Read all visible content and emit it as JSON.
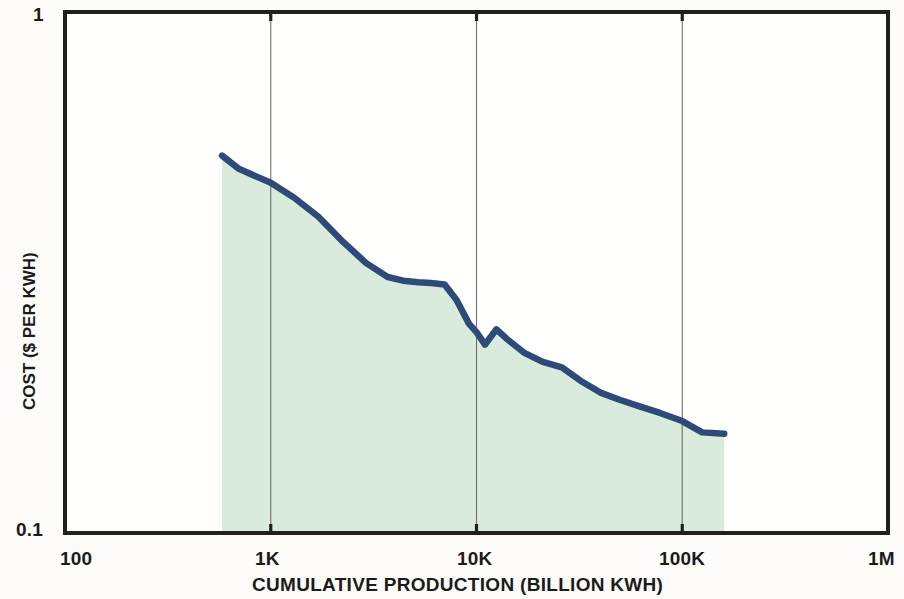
{
  "chart_data": {
    "type": "area",
    "title": "",
    "xlabel": "CUMULATIVE PRODUCTION (BILLION KWH)",
    "ylabel": "COST ($ PER KWH)",
    "x_scale": "log",
    "y_scale": "log",
    "xlim": [
      100,
      1000000
    ],
    "ylim": [
      0.1,
      1
    ],
    "x_tick_labels": [
      "100",
      "1K",
      "10K",
      "100K",
      "1M"
    ],
    "x_tick_values": [
      100,
      1000,
      10000,
      100000,
      1000000
    ],
    "y_tick_labels": [
      "0.1",
      "1"
    ],
    "y_tick_values": [
      0.1,
      1
    ],
    "gridlines_x": [
      1000,
      10000,
      100000
    ],
    "grid": true,
    "legend": "none",
    "series": [
      {
        "name": "Cost per KWH experience curve",
        "line_color": "#2d4a79",
        "fill_color": "#d8ebdc",
        "x": [
          580,
          700,
          1000,
          1300,
          1700,
          2200,
          2900,
          3700,
          4400,
          5200,
          6000,
          7000,
          8000,
          9200,
          10000,
          11000,
          12500,
          14000,
          17000,
          21000,
          26000,
          32000,
          40000,
          50000,
          62000,
          78000,
          100000,
          125000,
          160000
        ],
        "y": [
          0.53,
          0.5,
          0.47,
          0.44,
          0.405,
          0.365,
          0.33,
          0.31,
          0.305,
          0.303,
          0.302,
          0.3,
          0.28,
          0.252,
          0.243,
          0.23,
          0.246,
          0.236,
          0.222,
          0.213,
          0.208,
          0.196,
          0.186,
          0.18,
          0.175,
          0.17,
          0.164,
          0.156,
          0.155
        ]
      }
    ]
  },
  "axes": {
    "y_top_label": "1",
    "y_bottom_label": "0.1",
    "x_labels": [
      "100",
      "1K",
      "10K",
      "100K",
      "1M"
    ],
    "x_axis_title": "CUMULATIVE PRODUCTION (BILLION KWH)",
    "y_axis_title": "COST ($ PER KWH)"
  },
  "colors": {
    "line": "#2d4a79",
    "fill": "#d8ebdc",
    "border": "#231f20",
    "grid": "#6e6e6e",
    "background": "#fdfcf8"
  }
}
